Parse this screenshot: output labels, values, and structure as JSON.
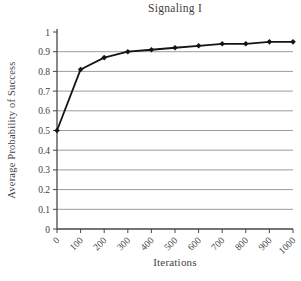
{
  "chart_data": {
    "type": "line",
    "title": "Signaling I",
    "xlabel": "Iterations",
    "ylabel": "Average Probability of Success",
    "x": [
      0,
      100,
      200,
      300,
      400,
      500,
      600,
      700,
      800,
      900,
      1000
    ],
    "values": [
      0.5,
      0.81,
      0.87,
      0.9,
      0.91,
      0.92,
      0.93,
      0.94,
      0.94,
      0.95,
      0.95
    ],
    "x_tick_labels": [
      "0",
      "100",
      "200",
      "300",
      "400",
      "500",
      "600",
      "700",
      "800",
      "900",
      "1000"
    ],
    "y_ticks": [
      0,
      0.1,
      0.2,
      0.3,
      0.4,
      0.5,
      0.6,
      0.7,
      0.8,
      0.9,
      1
    ],
    "y_tick_labels": [
      "0",
      "0.1",
      "0.2",
      "0.3",
      "0.4",
      "0.5",
      "0.6",
      "0.7",
      "0.8",
      "0.9",
      "1"
    ],
    "xlim": [
      0,
      1000
    ],
    "ylim": [
      0,
      1
    ],
    "grid": "horizontal-only",
    "legend": "none",
    "marker": "diamond",
    "colors": {
      "line": "#141414",
      "marker": "#141414",
      "gridline": "#9c9c9c",
      "axis": "#474747",
      "text": "#3f3f3f",
      "background": "#ffffff"
    }
  }
}
